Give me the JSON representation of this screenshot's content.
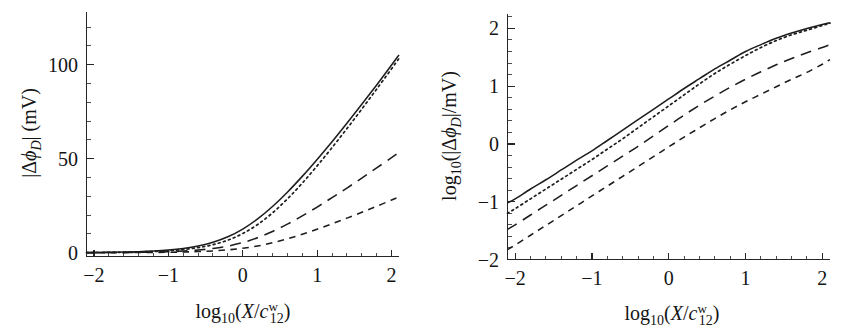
{
  "figure": {
    "background_color": "#ffffff",
    "ink_color": "#1d1d1d",
    "panel_count": 2
  },
  "panels": {
    "left": {
      "name": "linear-panel",
      "xlabel_parts": {
        "log": "log",
        "logsub": "10",
        "open": "(",
        "X": "X",
        "slash": "/",
        "c": "c",
        "csub": "12",
        "csup": "w",
        "close": ")"
      },
      "ylabel_parts": {
        "bar1": "|",
        "delta": "Δ",
        "phi": "ϕ",
        "phisub": "D",
        "bar2": "|",
        "unit": " (mV)"
      },
      "xticks": [
        "-2",
        "-1",
        "0",
        "1",
        "2"
      ],
      "yticks": [
        "0",
        "50",
        "100"
      ]
    },
    "right": {
      "name": "log-panel",
      "xlabel_parts": {
        "log": "log",
        "logsub": "10",
        "open": "(",
        "X": "X",
        "slash": "/",
        "c": "c",
        "csub": "12",
        "csup": "w",
        "close": ")"
      },
      "ylabel_parts": {
        "log": "log",
        "logsub": "10",
        "open": "(",
        "bar1": "|",
        "delta": "Δ",
        "phi": "ϕ",
        "phisub": "D",
        "bar2": "|",
        "slash": "/",
        "unit": "mV",
        "close": ")"
      },
      "xticks": [
        "-2",
        "-1",
        "0",
        "1",
        "2"
      ],
      "yticks": [
        "-2",
        "-1",
        "0",
        "1",
        "2"
      ]
    }
  },
  "chart_data": [
    {
      "type": "line",
      "panel": "left",
      "title": "",
      "xlabel": "log10(X/c^w_12)",
      "ylabel": "|Δϕ_D| (mV)",
      "xlim": [
        -2.1,
        2.1
      ],
      "ylim": [
        -2,
        128
      ],
      "grid": false,
      "legend": "none",
      "xticks_major": [
        -2,
        -1,
        0,
        1,
        2
      ],
      "yticks_major": [
        0,
        50,
        100
      ],
      "x": [
        -2.1,
        -2.0,
        -1.8,
        -1.6,
        -1.4,
        -1.2,
        -1.0,
        -0.8,
        -0.6,
        -0.4,
        -0.2,
        0.0,
        0.2,
        0.4,
        0.6,
        0.8,
        1.0,
        1.2,
        1.4,
        1.6,
        1.8,
        2.0,
        2.1
      ],
      "series": [
        {
          "name": "solid",
          "style": "solid",
          "values": [
            0.12,
            0.15,
            0.24,
            0.37,
            0.58,
            0.92,
            1.45,
            2.3,
            3.6,
            5.6,
            8.5,
            12.6,
            18.0,
            24.6,
            32.2,
            40.6,
            49.6,
            59.0,
            68.8,
            78.9,
            89.2,
            99.8,
            105.2
          ]
        },
        {
          "name": "dotted",
          "style": "dotted",
          "values": [
            0.09,
            0.11,
            0.17,
            0.27,
            0.43,
            0.68,
            1.08,
            1.72,
            2.72,
            4.3,
            6.7,
            10.2,
            15.0,
            21.2,
            28.6,
            37.0,
            46.2,
            55.9,
            66.0,
            76.4,
            87.0,
            97.8,
            103.3
          ]
        },
        {
          "name": "long-dash",
          "style": "longdash",
          "values": [
            0.05,
            0.06,
            0.09,
            0.14,
            0.22,
            0.35,
            0.56,
            0.9,
            1.42,
            2.25,
            3.5,
            5.4,
            8.0,
            11.3,
            15.2,
            19.6,
            24.3,
            29.3,
            34.4,
            39.7,
            45.1,
            50.6,
            53.4
          ]
        },
        {
          "name": "short-dash",
          "style": "shortdash",
          "values": [
            0.022,
            0.026,
            0.04,
            0.062,
            0.098,
            0.155,
            0.245,
            0.39,
            0.62,
            0.98,
            1.54,
            2.4,
            3.6,
            5.3,
            7.4,
            9.8,
            12.5,
            15.4,
            18.4,
            21.5,
            24.7,
            28.0,
            29.7
          ]
        }
      ]
    },
    {
      "type": "line",
      "panel": "right",
      "title": "",
      "xlabel": "log10(X/c^w_12)",
      "ylabel": "log10(|Δϕ_D|/mV)",
      "xlim": [
        -2.1,
        2.1
      ],
      "ylim": [
        -2.0,
        2.25
      ],
      "grid": false,
      "legend": "none",
      "xticks_major": [
        -2,
        -1,
        0,
        1,
        2
      ],
      "yticks_major": [
        -2,
        -1,
        0,
        1,
        2
      ],
      "x": [
        -2.1,
        -2.0,
        -1.8,
        -1.6,
        -1.4,
        -1.2,
        -1.0,
        -0.8,
        -0.6,
        -0.4,
        -0.2,
        0.0,
        0.2,
        0.4,
        0.6,
        0.8,
        1.0,
        1.2,
        1.4,
        1.6,
        1.8,
        2.0,
        2.1
      ],
      "series": [
        {
          "name": "solid",
          "style": "solid",
          "values": [
            -1.02,
            -0.95,
            -0.78,
            -0.62,
            -0.45,
            -0.28,
            -0.12,
            0.06,
            0.24,
            0.42,
            0.6,
            0.78,
            0.96,
            1.13,
            1.3,
            1.45,
            1.6,
            1.72,
            1.83,
            1.92,
            2.0,
            2.07,
            2.1
          ]
        },
        {
          "name": "dotted",
          "style": "dotted",
          "values": [
            -1.2,
            -1.12,
            -0.95,
            -0.78,
            -0.61,
            -0.44,
            -0.27,
            -0.09,
            0.09,
            0.28,
            0.47,
            0.66,
            0.85,
            1.04,
            1.22,
            1.38,
            1.53,
            1.67,
            1.79,
            1.89,
            1.97,
            2.05,
            2.09
          ]
        },
        {
          "name": "long-dash",
          "style": "longdash",
          "values": [
            -1.48,
            -1.4,
            -1.23,
            -1.06,
            -0.89,
            -0.72,
            -0.55,
            -0.38,
            -0.21,
            -0.04,
            0.14,
            0.32,
            0.5,
            0.67,
            0.83,
            0.98,
            1.12,
            1.25,
            1.37,
            1.48,
            1.58,
            1.67,
            1.72
          ]
        },
        {
          "name": "short-dash",
          "style": "shortdash",
          "values": [
            -1.83,
            -1.75,
            -1.58,
            -1.41,
            -1.24,
            -1.07,
            -0.9,
            -0.73,
            -0.56,
            -0.39,
            -0.22,
            -0.05,
            0.12,
            0.28,
            0.44,
            0.59,
            0.73,
            0.86,
            0.99,
            1.12,
            1.24,
            1.38,
            1.46
          ]
        }
      ]
    }
  ]
}
